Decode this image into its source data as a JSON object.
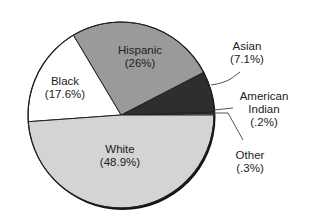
{
  "chart_data": {
    "type": "pie",
    "title": "",
    "categories": [
      "White",
      "Black",
      "Hispanic",
      "Asian",
      "American Indian",
      "Other"
    ],
    "values": [
      48.9,
      17.6,
      26,
      7.1,
      0.2,
      0.3
    ],
    "labels": [
      {
        "name": "White",
        "value": "(48.9%)"
      },
      {
        "name": "Black",
        "value": "(17.6%)"
      },
      {
        "name": "Hispanic",
        "value": "(26%)"
      },
      {
        "name": "Asian",
        "value": "(7.1%)"
      },
      {
        "name_line1": "American",
        "name_line2": "Indian",
        "value": "(.2%)"
      },
      {
        "name": "Other",
        "value": "(.3%)"
      }
    ],
    "colors": {
      "White": "#d4d4d4",
      "Black": "#ffffff",
      "Hispanic": "#9a9a9a",
      "Asian": "#2e2e2e",
      "American Indian": "#8a8a8a",
      "Other": "#c8c8c8"
    },
    "legend": "none (callout labels)"
  }
}
